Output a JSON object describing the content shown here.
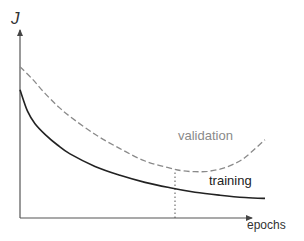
{
  "chart_data": {
    "type": "line",
    "title": "",
    "xlabel": "epochs",
    "ylabel": "J",
    "grid": false,
    "xlim": [
      0,
      10
    ],
    "ylim": [
      0,
      10
    ],
    "ticks": {
      "x": [],
      "y": []
    },
    "series": [
      {
        "name": "validation",
        "style": "dashed",
        "color": "#8a8a8a",
        "x": [
          0,
          0.5,
          1,
          1.5,
          2,
          3,
          4,
          5,
          6,
          6.5,
          7,
          7.5,
          8,
          8.5,
          9,
          9.8
        ],
        "y": [
          8.5,
          7.8,
          7.0,
          6.3,
          5.7,
          4.7,
          3.9,
          3.2,
          2.8,
          2.65,
          2.6,
          2.62,
          2.75,
          3.0,
          3.4,
          4.4
        ]
      },
      {
        "name": "training",
        "style": "solid",
        "color": "#222222",
        "x": [
          0,
          0.3,
          0.6,
          1,
          1.5,
          2,
          3,
          4,
          5,
          6,
          7,
          8,
          9,
          9.8
        ],
        "y": [
          7.2,
          6.0,
          5.3,
          4.7,
          4.1,
          3.6,
          2.9,
          2.4,
          2.0,
          1.7,
          1.45,
          1.28,
          1.15,
          1.1
        ]
      }
    ],
    "annotations": [
      {
        "type": "vertical-dotted-line",
        "x": 6.2,
        "y_from": 0,
        "y_to": 2.62,
        "meaning": "early-stopping point at validation minimum"
      },
      {
        "type": "label",
        "text": "validation",
        "series": "validation"
      },
      {
        "type": "label",
        "text": "training",
        "series": "training"
      }
    ]
  }
}
